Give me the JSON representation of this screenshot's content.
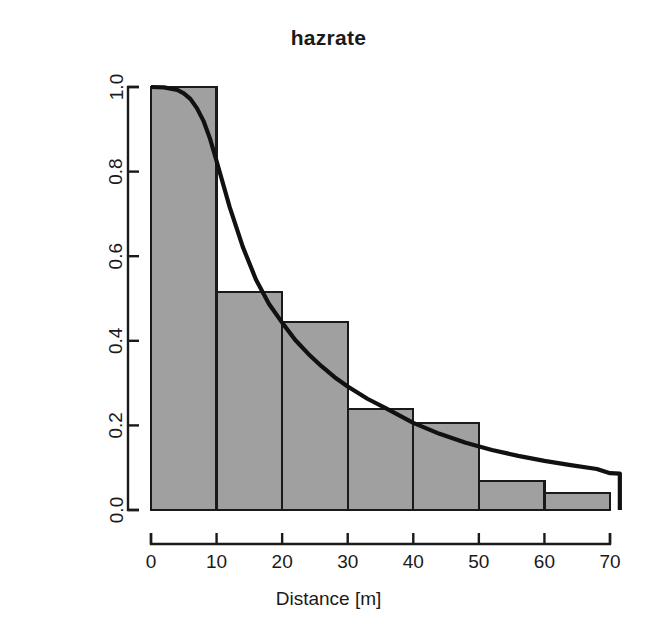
{
  "chart_data": {
    "type": "bar",
    "title": "hazrate",
    "xlabel": "Distance [m]",
    "ylabel": "Probability of detection",
    "xlim": [
      0,
      72
    ],
    "ylim": [
      0.0,
      1.0
    ],
    "grid": false,
    "legend": null,
    "xticks": [
      0,
      10,
      20,
      30,
      40,
      50,
      60,
      70
    ],
    "xtick_labels": [
      "0",
      "10",
      "20",
      "30",
      "40",
      "50",
      "60",
      "70"
    ],
    "yticks": [
      0.0,
      0.2,
      0.4,
      0.6,
      0.8,
      1.0
    ],
    "ytick_labels": [
      "0.0",
      "0.2",
      "0.4",
      "0.6",
      "0.8",
      "1.0"
    ],
    "bar_fill_color": "#a0a0a0",
    "bar_edge_color": "#1a1a1a",
    "line_color": "#111111",
    "bins": [
      {
        "x0": 0,
        "x1": 10,
        "value": 1.0
      },
      {
        "x0": 10,
        "x1": 20,
        "value": 0.515
      },
      {
        "x0": 20,
        "x1": 30,
        "value": 0.445
      },
      {
        "x0": 30,
        "x1": 40,
        "value": 0.239
      },
      {
        "x0": 40,
        "x1": 50,
        "value": 0.206
      },
      {
        "x0": 50,
        "x1": 60,
        "value": 0.069
      },
      {
        "x0": 60,
        "x1": 70,
        "value": 0.04
      }
    ],
    "categories": [
      "0-10",
      "10-20",
      "20-30",
      "30-40",
      "40-50",
      "50-60",
      "60-70"
    ],
    "values": [
      1.0,
      0.515,
      0.445,
      0.239,
      0.206,
      0.069,
      0.04
    ],
    "series": [
      {
        "name": "hazard-rate detection function",
        "type": "line",
        "x": [
          0,
          2,
          4,
          5,
          6,
          7,
          8,
          9,
          10,
          12,
          14,
          16,
          18,
          20,
          22,
          24,
          26,
          28,
          30,
          33,
          36,
          40,
          44,
          48,
          52,
          56,
          60,
          64,
          68,
          70,
          71.5
        ],
        "y": [
          1.0,
          0.999,
          0.993,
          0.985,
          0.972,
          0.95,
          0.92,
          0.878,
          0.825,
          0.716,
          0.622,
          0.545,
          0.487,
          0.443,
          0.402,
          0.369,
          0.34,
          0.314,
          0.292,
          0.263,
          0.239,
          0.206,
          0.18,
          0.159,
          0.142,
          0.128,
          0.116,
          0.106,
          0.097,
          0.087,
          0.086
        ]
      }
    ],
    "axis_drop_at_x": 71.5
  },
  "plot_geometry": {
    "left_px": 151,
    "right_px": 610,
    "top_px": 87,
    "bottom_px": 510,
    "x_axis_right_px": 623
  }
}
